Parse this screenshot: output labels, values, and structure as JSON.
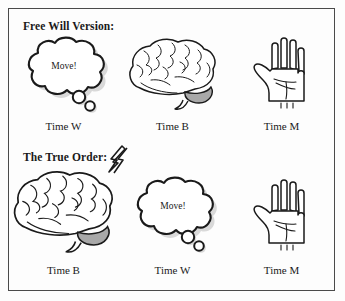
{
  "figure": {
    "background_color": "#fdfdfd",
    "border_color": "#4a4a4a",
    "ink_color": "#1a1a1a",
    "shade_color": "#a8a8a8",
    "shadow_color": "#bdbdbd"
  },
  "rows": [
    {
      "heading": "Free Will Version:",
      "has_bolt": false,
      "panels": [
        {
          "icon": "thought-bubble-icon",
          "bubble_text": "Move!",
          "caption": "Time W"
        },
        {
          "icon": "brain-icon",
          "bubble_text": "",
          "caption": "Time B"
        },
        {
          "icon": "hand-icon",
          "bubble_text": "",
          "caption": "Time M"
        }
      ]
    },
    {
      "heading": "The True Order:",
      "has_bolt": true,
      "bolt_icon": "lightning-bolt-icon",
      "panels": [
        {
          "icon": "brain-icon",
          "bubble_text": "",
          "caption": "Time B"
        },
        {
          "icon": "thought-bubble-icon",
          "bubble_text": "Move!",
          "caption": "Time W"
        },
        {
          "icon": "hand-icon",
          "bubble_text": "",
          "caption": "Time M"
        }
      ]
    }
  ]
}
